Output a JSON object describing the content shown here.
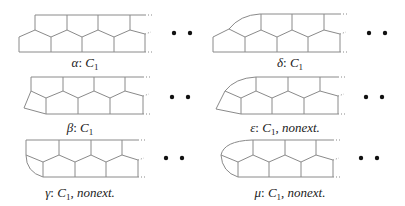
{
  "figure": {
    "panels": [
      {
        "id": "alpha",
        "symbol": "α",
        "label": "α: C₁",
        "group": "C₁",
        "suffix": ""
      },
      {
        "id": "delta",
        "symbol": "δ",
        "label": "δ: C₁",
        "group": "C₁",
        "suffix": ""
      },
      {
        "id": "beta",
        "symbol": "β",
        "label": "β: C₁",
        "group": "C₁",
        "suffix": ""
      },
      {
        "id": "epsilon",
        "symbol": "ε",
        "label": "ε: C₁, nonext.",
        "group": "C₁",
        "suffix": "nonext."
      },
      {
        "id": "gamma",
        "symbol": "γ",
        "label": "γ: C₁, nonext.",
        "group": "C₁",
        "suffix": "nonext."
      },
      {
        "id": "mu",
        "symbol": "μ",
        "label": "μ: C₁, nonext.",
        "group": "C₁",
        "suffix": "nonext."
      }
    ],
    "continuation": "• •",
    "colors": {
      "edge": "#8a8a8a",
      "dot": "#111111",
      "text": "#222222"
    }
  }
}
